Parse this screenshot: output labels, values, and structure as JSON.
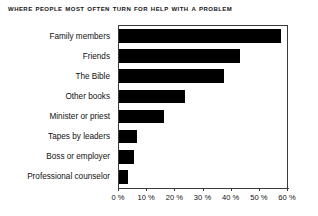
{
  "chart_data": {
    "type": "bar",
    "orientation": "horizontal",
    "title": "Where People Most Often Turn for Help With a Problem",
    "xlabel": "",
    "ylabel": "",
    "xlim": [
      0,
      60
    ],
    "grid": false,
    "legend": null,
    "bar_color": "#000000",
    "axis_color": "#3a3a3a",
    "categories": [
      "Family members",
      "Friends",
      "The Bible",
      "Other books",
      "Minister or priest",
      "Tapes by leaders",
      "Boss or employer",
      "Professional counselor"
    ],
    "values": [
      57,
      42.5,
      37,
      23,
      15.5,
      6,
      5,
      3
    ],
    "x_ticks": [
      0,
      10,
      20,
      30,
      40,
      50,
      60
    ],
    "x_tick_labels": [
      "0 %",
      "10 %",
      "20 %",
      "30 %",
      "40 %",
      "50 %",
      "60 %"
    ]
  }
}
